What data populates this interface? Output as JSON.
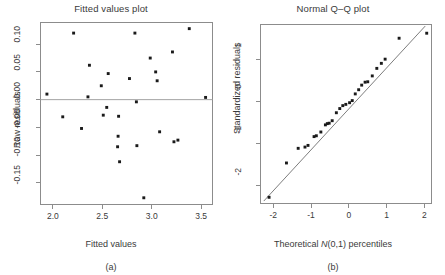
{
  "figure": {
    "panels": [
      {
        "id": "a",
        "caption": "(a)",
        "title": "Fitted values plot",
        "xlabel": "Fitted values",
        "ylabel": "Raw residuals"
      },
      {
        "id": "b",
        "caption": "(b)",
        "title": "Normal Q–Q plot",
        "xlabel_prefix": "Theoretical ",
        "xlabel_italic": "N",
        "xlabel_suffix": "(0,1) percentiles",
        "ylabel": "Standardized residuals"
      }
    ]
  },
  "chart_data": [
    {
      "type": "scatter",
      "title": "Fitted values plot",
      "xlabel": "Fitted values",
      "ylabel": "Raw residuals",
      "xlim": [
        1.87,
        3.62
      ],
      "ylim": [
        -0.19,
        0.14
      ],
      "xticks": [
        2.0,
        2.5,
        3.0,
        3.5
      ],
      "xticklabels": [
        "2.0",
        "2.5",
        "3.0",
        "3.5"
      ],
      "yticks": [
        0.1,
        0.05,
        0.0,
        -0.05,
        -0.1,
        -0.15
      ],
      "yticklabels": [
        "0.10",
        "0.05",
        "0.00",
        "-0.05",
        "-0.10",
        "-0.15"
      ],
      "grid": false,
      "legend": "none",
      "reference_line": {
        "type": "horizontal",
        "y": 0.0
      },
      "points": [
        {
          "x": 1.94,
          "y": 0.01
        },
        {
          "x": 2.1,
          "y": -0.031
        },
        {
          "x": 2.21,
          "y": 0.12
        },
        {
          "x": 2.29,
          "y": -0.052
        },
        {
          "x": 2.355,
          "y": 0.005
        },
        {
          "x": 2.37,
          "y": 0.062
        },
        {
          "x": 2.49,
          "y": 0.025
        },
        {
          "x": 2.51,
          "y": -0.028
        },
        {
          "x": 2.545,
          "y": -0.014
        },
        {
          "x": 2.56,
          "y": 0.047
        },
        {
          "x": 2.655,
          "y": -0.085
        },
        {
          "x": 2.66,
          "y": -0.066
        },
        {
          "x": 2.665,
          "y": -0.03
        },
        {
          "x": 2.675,
          "y": -0.112
        },
        {
          "x": 2.775,
          "y": 0.038
        },
        {
          "x": 2.83,
          "y": 0.12
        },
        {
          "x": 2.845,
          "y": -0.004
        },
        {
          "x": 2.85,
          "y": -0.083
        },
        {
          "x": 2.92,
          "y": -0.177
        },
        {
          "x": 2.985,
          "y": 0.075
        },
        {
          "x": 3.04,
          "y": 0.05
        },
        {
          "x": 3.055,
          "y": 0.034
        },
        {
          "x": 3.08,
          "y": -0.058
        },
        {
          "x": 3.21,
          "y": 0.086
        },
        {
          "x": 3.225,
          "y": -0.076
        },
        {
          "x": 3.265,
          "y": -0.073
        },
        {
          "x": 3.38,
          "y": 0.128
        },
        {
          "x": 3.545,
          "y": 0.004
        }
      ]
    },
    {
      "type": "scatter",
      "title": "Normal Q–Q plot",
      "xlabel": "Theoretical N(0,1) percentiles",
      "ylabel": "Standardized residuals",
      "xlim": [
        -2.35,
        2.2
      ],
      "ylim": [
        -2.45,
        1.85
      ],
      "xticks": [
        -2,
        -1,
        0,
        1,
        2
      ],
      "xticklabels": [
        "-2",
        "-1",
        "0",
        "1",
        "2"
      ],
      "yticks": [
        1,
        0,
        -1,
        -2
      ],
      "yticklabels": [
        "1",
        "0",
        "-1",
        "-2"
      ],
      "grid": false,
      "legend": "none",
      "reference_line": {
        "type": "diagonal",
        "x1": -2.25,
        "y1": -2.38,
        "x2": 2.02,
        "y2": 1.8
      },
      "points": [
        {
          "x": -2.11,
          "y": -2.29
        },
        {
          "x": -1.65,
          "y": -1.47
        },
        {
          "x": -1.34,
          "y": -1.12
        },
        {
          "x": -1.16,
          "y": -1.09
        },
        {
          "x": -1.08,
          "y": -1.05
        },
        {
          "x": -0.92,
          "y": -0.84
        },
        {
          "x": -0.86,
          "y": -0.82
        },
        {
          "x": -0.74,
          "y": -0.73
        },
        {
          "x": -0.62,
          "y": -0.56
        },
        {
          "x": -0.57,
          "y": -0.53
        },
        {
          "x": -0.52,
          "y": -0.52
        },
        {
          "x": -0.44,
          "y": -0.46
        },
        {
          "x": -0.33,
          "y": -0.27
        },
        {
          "x": -0.24,
          "y": -0.17
        },
        {
          "x": -0.16,
          "y": -0.1
        },
        {
          "x": -0.08,
          "y": -0.07
        },
        {
          "x": 0.02,
          "y": -0.03
        },
        {
          "x": 0.09,
          "y": 0.02
        },
        {
          "x": 0.17,
          "y": 0.18
        },
        {
          "x": 0.26,
          "y": 0.28
        },
        {
          "x": 0.34,
          "y": 0.39
        },
        {
          "x": 0.43,
          "y": 0.46
        },
        {
          "x": 0.5,
          "y": 0.47
        },
        {
          "x": 0.62,
          "y": 0.61
        },
        {
          "x": 0.74,
          "y": 0.79
        },
        {
          "x": 0.86,
          "y": 0.91
        },
        {
          "x": 0.96,
          "y": 1.01
        },
        {
          "x": 1.33,
          "y": 1.51
        },
        {
          "x": 2.06,
          "y": 1.63
        }
      ]
    }
  ]
}
